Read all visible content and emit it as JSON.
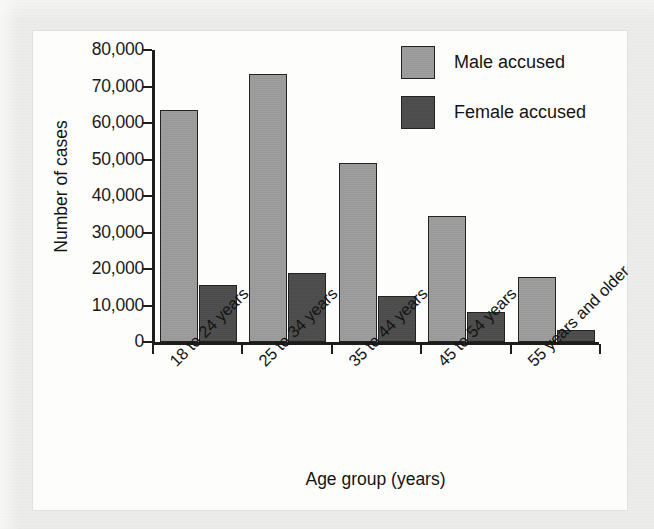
{
  "chart_data": {
    "type": "bar",
    "title": "",
    "xlabel": "Age group (years)",
    "ylabel": "Number of cases",
    "categories": [
      "18 to 24 years",
      "25 to 34 years",
      "35 to 44 years",
      "45 to 54 years",
      "55 years and older"
    ],
    "series": [
      {
        "name": "Male accused",
        "color": "#9c9c9c",
        "values": [
          63500,
          73500,
          49000,
          34500,
          17800
        ]
      },
      {
        "name": "Female accused",
        "color": "#4c4c4c",
        "values": [
          15700,
          18800,
          12700,
          8300,
          3400
        ]
      }
    ],
    "ylim": [
      0,
      80000
    ],
    "ytick_values": [
      0,
      10000,
      20000,
      30000,
      40000,
      50000,
      60000,
      70000,
      80000
    ],
    "ytick_labels": [
      "0",
      "10,000",
      "20,000",
      "30,000",
      "40,000",
      "50,000",
      "60,000",
      "70,000",
      "80,000"
    ],
    "grid": false,
    "legend_position": "top-right",
    "xtick_label_rotation": -45
  },
  "legend": {
    "entries": [
      {
        "label": "Male accused",
        "swatch": "male"
      },
      {
        "label": "Female accused",
        "swatch": "female"
      }
    ]
  },
  "colors": {
    "male_bar": "#9c9c9c",
    "female_bar": "#4c4c4c",
    "axis": "#1d1d1d",
    "panel_background": "#fdfdfc",
    "page_background": "#ececeb"
  }
}
